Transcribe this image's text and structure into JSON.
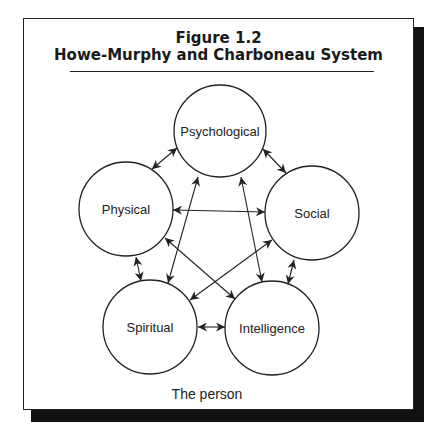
{
  "figure": {
    "number": "Figure 1.2",
    "title": "Howe-Murphy and Charboneau System",
    "caption": "The person"
  },
  "nodes": [
    {
      "id": "psychological",
      "label": "Psychological",
      "cx": 220,
      "cy": 131,
      "r": 46
    },
    {
      "id": "physical",
      "label": "Physical",
      "cx": 126,
      "cy": 209,
      "r": 47
    },
    {
      "id": "social",
      "label": "Social",
      "cx": 312,
      "cy": 213,
      "r": 47
    },
    {
      "id": "spiritual",
      "label": "Spiritual",
      "cx": 150,
      "cy": 327,
      "r": 47
    },
    {
      "id": "intelligence",
      "label": "Intelligence",
      "cx": 272,
      "cy": 328,
      "r": 47
    }
  ],
  "edges": [
    {
      "from": "physical",
      "to": "psychological",
      "type": "bidirectional"
    },
    {
      "from": "psychological",
      "to": "social",
      "type": "bidirectional"
    },
    {
      "from": "physical",
      "to": "spiritual",
      "type": "bidirectional"
    },
    {
      "from": "social",
      "to": "intelligence",
      "type": "bidirectional"
    },
    {
      "from": "spiritual",
      "to": "intelligence",
      "type": "bidirectional"
    },
    {
      "from": "physical",
      "to": "social",
      "type": "bidirectional"
    },
    {
      "from": "psychological",
      "to": "spiritual",
      "type": "bidirectional"
    },
    {
      "from": "psychological",
      "to": "intelligence",
      "type": "bidirectional"
    },
    {
      "from": "physical",
      "to": "intelligence",
      "type": "bidirectional"
    },
    {
      "from": "social",
      "to": "spiritual",
      "type": "bidirectional"
    }
  ],
  "colors": {
    "stroke": "#222222",
    "shadow": "#111111",
    "background": "#ffffff"
  }
}
